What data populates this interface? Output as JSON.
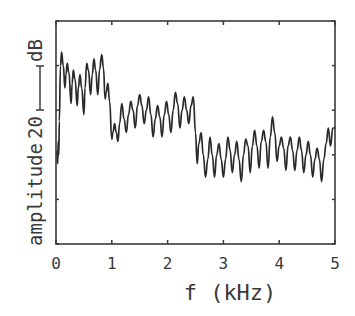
{
  "chart_data": {
    "type": "line",
    "title": "",
    "xlabel": "f (kHz)",
    "ylabel": "amplitude",
    "scale_bar": {
      "label": "20",
      "unit": "dB",
      "value": 20
    },
    "xlim": [
      0,
      5
    ],
    "ylim": [
      0,
      100
    ],
    "x_ticks": [
      0,
      1,
      2,
      3,
      4,
      5
    ],
    "x_tick_labels": [
      "0",
      "1",
      "2",
      "3",
      "4",
      "5"
    ],
    "y_ticks": [
      0,
      20,
      40,
      60,
      80,
      100
    ],
    "grid": false,
    "legend": "none",
    "series": [
      {
        "name": "spectrum",
        "color": "#2a2a2a",
        "x": [
          0.02,
          0.03,
          0.04,
          0.05,
          0.06,
          0.08,
          0.1,
          0.13,
          0.16,
          0.18,
          0.2,
          0.23,
          0.27,
          0.29,
          0.31,
          0.34,
          0.38,
          0.4,
          0.43,
          0.46,
          0.5,
          0.52,
          0.55,
          0.58,
          0.62,
          0.65,
          0.68,
          0.71,
          0.75,
          0.78,
          0.82,
          0.85,
          0.88,
          0.9,
          0.93,
          0.96,
          1.0,
          1.02,
          1.05,
          1.08,
          1.11,
          1.14,
          1.18,
          1.22,
          1.26,
          1.3,
          1.34,
          1.38,
          1.42,
          1.46,
          1.5,
          1.54,
          1.58,
          1.62,
          1.66,
          1.7,
          1.74,
          1.78,
          1.82,
          1.86,
          1.9,
          1.94,
          1.98,
          2.02,
          2.06,
          2.1,
          2.14,
          2.18,
          2.22,
          2.26,
          2.3,
          2.34,
          2.38,
          2.42,
          2.46,
          2.5,
          2.53,
          2.56,
          2.6,
          2.64,
          2.68,
          2.72,
          2.76,
          2.8,
          2.84,
          2.88,
          2.92,
          2.96,
          3.0,
          3.04,
          3.08,
          3.12,
          3.16,
          3.2,
          3.24,
          3.28,
          3.32,
          3.36,
          3.4,
          3.44,
          3.48,
          3.52,
          3.56,
          3.6,
          3.64,
          3.68,
          3.72,
          3.76,
          3.8,
          3.84,
          3.88,
          3.92,
          3.96,
          4.0,
          4.04,
          4.08,
          4.12,
          4.16,
          4.2,
          4.24,
          4.28,
          4.32,
          4.36,
          4.4,
          4.44,
          4.48,
          4.52,
          4.56,
          4.6,
          4.64,
          4.68,
          4.72,
          4.76,
          4.8,
          4.84,
          4.88,
          4.92,
          4.96,
          5.0
        ],
        "y": [
          42,
          36,
          46,
          40,
          55,
          80,
          86,
          80,
          70,
          76,
          81,
          77,
          63,
          72,
          78,
          74,
          62,
          70,
          76,
          70,
          58,
          70,
          81,
          78,
          67,
          76,
          83,
          78,
          67,
          78,
          85,
          79,
          65,
          68,
          72,
          64,
          47,
          50,
          54,
          50,
          46,
          54,
          63,
          56,
          50,
          58,
          64,
          60,
          52,
          62,
          67,
          62,
          54,
          60,
          66,
          58,
          48,
          56,
          62,
          57,
          48,
          58,
          64,
          58,
          50,
          60,
          68,
          63,
          52,
          60,
          66,
          60,
          54,
          62,
          66,
          50,
          36,
          45,
          50,
          40,
          30,
          38,
          48,
          40,
          30,
          40,
          45,
          38,
          30,
          38,
          48,
          42,
          32,
          40,
          46,
          38,
          28,
          40,
          47,
          44,
          32,
          44,
          51,
          44,
          34,
          46,
          51,
          46,
          34,
          48,
          57,
          50,
          37,
          44,
          48,
          43,
          33,
          44,
          48,
          42,
          33,
          42,
          48,
          42,
          32,
          40,
          46,
          40,
          30,
          38,
          43,
          38,
          28,
          38,
          45,
          52,
          44,
          52,
          52
        ]
      }
    ]
  }
}
